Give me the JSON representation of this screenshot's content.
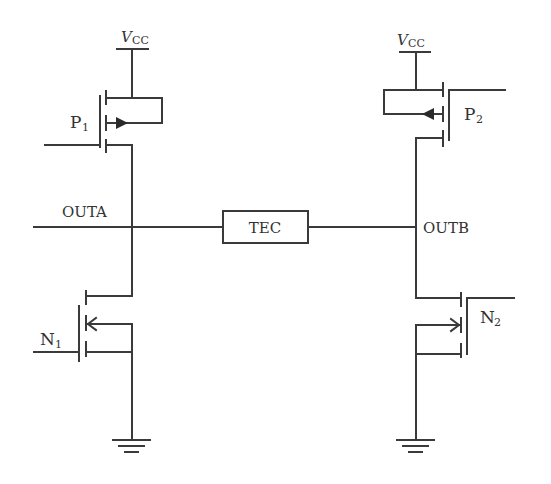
{
  "diagram": {
    "type": "H-bridge driver circuit",
    "labels": {
      "vcc_left": "V",
      "vcc_left_sub": "CC",
      "vcc_right": "V",
      "vcc_right_sub": "CC",
      "p1": "P",
      "p1_sub": "1",
      "p2": "P",
      "p2_sub": "2",
      "n1": "N",
      "n1_sub": "1",
      "n2": "N",
      "n2_sub": "2",
      "outa": "OUTA",
      "outb": "OUTB",
      "tec": "TEC"
    },
    "components": [
      {
        "id": "P1",
        "kind": "PMOS",
        "side": "left",
        "connects": [
          "VCC",
          "OUTA"
        ]
      },
      {
        "id": "N1",
        "kind": "NMOS",
        "side": "left",
        "connects": [
          "OUTA",
          "GND"
        ]
      },
      {
        "id": "P2",
        "kind": "PMOS",
        "side": "right",
        "connects": [
          "VCC",
          "OUTB"
        ]
      },
      {
        "id": "N2",
        "kind": "NMOS",
        "side": "right",
        "connects": [
          "OUTB",
          "GND"
        ]
      },
      {
        "id": "TEC",
        "kind": "load",
        "connects": [
          "OUTA",
          "OUTB"
        ]
      }
    ]
  }
}
